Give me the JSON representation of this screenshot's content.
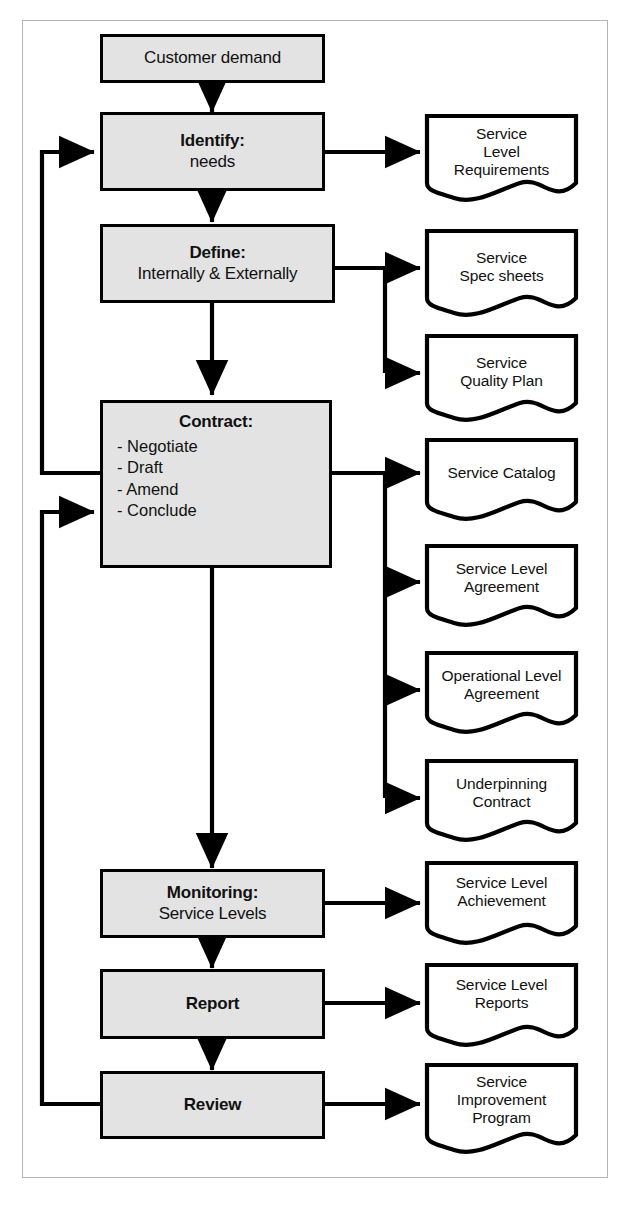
{
  "diagram": {
    "colors": {
      "process_fill": "#e3e3e3",
      "process_stroke": "#000000",
      "document_fill": "#ffffff",
      "document_stroke": "#000000",
      "frame_border": "#b5b5b5",
      "background": "#ffffff",
      "text": "#111111"
    },
    "process_boxes": [
      {
        "id": "customer-demand",
        "title": "Customer demand",
        "subtitle": "",
        "bullets": [],
        "bold_title": false
      },
      {
        "id": "identify",
        "title": "Identify:",
        "subtitle": "needs",
        "bullets": [],
        "bold_title": true
      },
      {
        "id": "define",
        "title": "Define:",
        "subtitle": "Internally & Externally",
        "bullets": [],
        "bold_title": true
      },
      {
        "id": "contract",
        "title": "Contract:",
        "subtitle": "",
        "bullets": [
          "- Negotiate",
          "- Draft",
          "- Amend",
          "- Conclude"
        ],
        "bold_title": true
      },
      {
        "id": "monitoring",
        "title": "Monitoring:",
        "subtitle": "Service Levels",
        "bullets": [],
        "bold_title": true
      },
      {
        "id": "report",
        "title": "Report",
        "subtitle": "",
        "bullets": [],
        "bold_title": true
      },
      {
        "id": "review",
        "title": "Review",
        "subtitle": "",
        "bullets": [],
        "bold_title": true
      }
    ],
    "documents": [
      {
        "id": "service-level-requirements",
        "lines": [
          "Service",
          "Level",
          "Requirements"
        ],
        "source": "identify"
      },
      {
        "id": "service-spec-sheets",
        "lines": [
          "Service",
          "Spec sheets"
        ],
        "source": "define"
      },
      {
        "id": "service-quality-plan",
        "lines": [
          "Service",
          "Quality Plan"
        ],
        "source": "define"
      },
      {
        "id": "service-catalog",
        "lines": [
          "Service Catalog"
        ],
        "source": "contract"
      },
      {
        "id": "service-level-agreement",
        "lines": [
          "Service Level",
          "Agreement"
        ],
        "source": "contract"
      },
      {
        "id": "operational-level-agreement",
        "lines": [
          "Operational Level",
          "Agreement"
        ],
        "source": "contract"
      },
      {
        "id": "underpinning-contract",
        "lines": [
          "Underpinning",
          "Contract"
        ],
        "source": "contract"
      },
      {
        "id": "service-level-achievement",
        "lines": [
          "Service Level",
          "Achievement"
        ],
        "source": "monitoring"
      },
      {
        "id": "service-level-reports",
        "lines": [
          "Service Level",
          "Reports"
        ],
        "source": "report"
      },
      {
        "id": "service-improvement-program",
        "lines": [
          "Service",
          "Improvement",
          "Program"
        ],
        "source": "review"
      }
    ],
    "flow_sequence": [
      {
        "from": "customer-demand",
        "to": "identify",
        "kind": "down-arrow"
      },
      {
        "from": "identify",
        "to": "define",
        "kind": "down-arrow"
      },
      {
        "from": "define",
        "to": "contract",
        "kind": "down-arrow"
      },
      {
        "from": "contract",
        "to": "monitoring",
        "kind": "down-arrow"
      },
      {
        "from": "monitoring",
        "to": "report",
        "kind": "down-arrow"
      },
      {
        "from": "report",
        "to": "review",
        "kind": "down-arrow"
      }
    ],
    "feedback_loops": [
      {
        "id": "contract-to-identify",
        "from": "contract",
        "to": "identify",
        "kind": "left-loop-up"
      },
      {
        "id": "review-to-contract",
        "from": "review",
        "to": "contract",
        "kind": "left-loop-up"
      }
    ]
  }
}
